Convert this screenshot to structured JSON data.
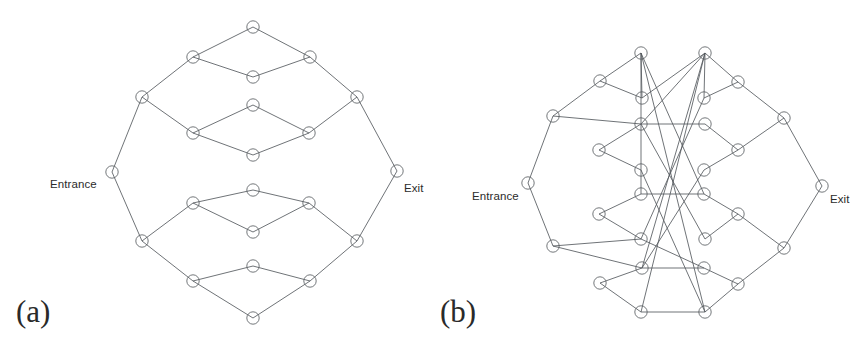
{
  "figure": {
    "background_color": "#ffffff",
    "edge_color": "#555a5e",
    "node_stroke_color": "#5b6063",
    "node_radius": 6.2,
    "terminal_node_radius": 6.2
  },
  "panels": [
    {
      "id": "a",
      "caption": "(a)",
      "caption_x": 16,
      "caption_y": 322,
      "entrance_label": "Entrance",
      "entrance_label_x": 50,
      "entrance_label_y": 188,
      "exit_label": "Exit",
      "exit_label_x": 404,
      "exit_label_y": 192,
      "nodes": [
        {
          "name": "entrance",
          "x": 112,
          "y": 172
        },
        {
          "name": "exit",
          "x": 397,
          "y": 171
        },
        {
          "name": "n-top",
          "x": 253,
          "y": 27
        },
        {
          "name": "n-top-left",
          "x": 193,
          "y": 57
        },
        {
          "name": "n-top-right",
          "x": 310,
          "y": 57
        },
        {
          "name": "n-upper-mid-1",
          "x": 253,
          "y": 77
        },
        {
          "name": "n-upper-left-outer",
          "x": 142,
          "y": 97
        },
        {
          "name": "n-upper-right-outer",
          "x": 357,
          "y": 97
        },
        {
          "name": "n-inner-top",
          "x": 253,
          "y": 105
        },
        {
          "name": "n-inner-upper-left",
          "x": 193,
          "y": 133
        },
        {
          "name": "n-inner-upper-right",
          "x": 309,
          "y": 133
        },
        {
          "name": "n-inner-upper-bottom",
          "x": 253,
          "y": 155
        },
        {
          "name": "n-inner-lower-top",
          "x": 253,
          "y": 190
        },
        {
          "name": "n-inner-lower-left",
          "x": 193,
          "y": 203
        },
        {
          "name": "n-inner-lower-right",
          "x": 309,
          "y": 203
        },
        {
          "name": "n-inner-bottom",
          "x": 253,
          "y": 232
        },
        {
          "name": "n-lower-left-outer",
          "x": 142,
          "y": 241
        },
        {
          "name": "n-lower-right-outer",
          "x": 357,
          "y": 241
        },
        {
          "name": "n-lower-mid-1",
          "x": 253,
          "y": 266
        },
        {
          "name": "n-bottom-left",
          "x": 193,
          "y": 281
        },
        {
          "name": "n-bottom-right",
          "x": 310,
          "y": 281
        },
        {
          "name": "n-bottom",
          "x": 253,
          "y": 318
        }
      ],
      "edges": [
        [
          "entrance",
          "n-upper-left-outer"
        ],
        [
          "entrance",
          "n-lower-left-outer"
        ],
        [
          "exit",
          "n-upper-right-outer"
        ],
        [
          "exit",
          "n-lower-right-outer"
        ],
        [
          "n-upper-left-outer",
          "n-top-left"
        ],
        [
          "n-top-left",
          "n-top"
        ],
        [
          "n-top",
          "n-top-right"
        ],
        [
          "n-top-right",
          "n-upper-right-outer"
        ],
        [
          "n-top-left",
          "n-upper-mid-1"
        ],
        [
          "n-upper-mid-1",
          "n-top-right"
        ],
        [
          "n-upper-left-outer",
          "n-inner-upper-left"
        ],
        [
          "n-inner-upper-left",
          "n-inner-top"
        ],
        [
          "n-inner-top",
          "n-inner-upper-right"
        ],
        [
          "n-inner-upper-right",
          "n-upper-right-outer"
        ],
        [
          "n-inner-upper-left",
          "n-inner-upper-bottom"
        ],
        [
          "n-inner-upper-bottom",
          "n-inner-upper-right"
        ],
        [
          "n-lower-left-outer",
          "n-inner-lower-left"
        ],
        [
          "n-inner-lower-left",
          "n-inner-lower-top"
        ],
        [
          "n-inner-lower-top",
          "n-inner-lower-right"
        ],
        [
          "n-inner-lower-right",
          "n-lower-right-outer"
        ],
        [
          "n-inner-lower-left",
          "n-inner-bottom"
        ],
        [
          "n-inner-bottom",
          "n-inner-lower-right"
        ],
        [
          "n-lower-left-outer",
          "n-bottom-left"
        ],
        [
          "n-bottom-left",
          "n-lower-mid-1"
        ],
        [
          "n-lower-mid-1",
          "n-bottom-right"
        ],
        [
          "n-bottom-right",
          "n-lower-right-outer"
        ],
        [
          "n-bottom-left",
          "n-bottom"
        ],
        [
          "n-bottom",
          "n-bottom-right"
        ]
      ]
    },
    {
      "id": "b",
      "caption": "(b)",
      "caption_x": 8,
      "caption_y": 322,
      "entrance_label": "Entrance",
      "entrance_label_x": 40,
      "entrance_label_y": 200,
      "exit_label": "Exit",
      "exit_label_x": 398,
      "exit_label_y": 203,
      "nodes": [
        {
          "name": "entrance",
          "x": 96,
          "y": 183
        },
        {
          "name": "exit",
          "x": 390,
          "y": 186
        },
        {
          "name": "n-top-left",
          "x": 209,
          "y": 53
        },
        {
          "name": "n-top-right",
          "x": 273,
          "y": 53
        },
        {
          "name": "n-ul-1",
          "x": 168,
          "y": 81
        },
        {
          "name": "n-ur-1",
          "x": 306,
          "y": 82
        },
        {
          "name": "n-ul-2",
          "x": 210,
          "y": 98
        },
        {
          "name": "n-ur-2",
          "x": 272,
          "y": 98
        },
        {
          "name": "n-left-outer-top",
          "x": 121,
          "y": 116
        },
        {
          "name": "n-right-outer-top",
          "x": 352,
          "y": 118
        },
        {
          "name": "n-ul-3",
          "x": 209,
          "y": 124
        },
        {
          "name": "n-ur-3",
          "x": 273,
          "y": 124
        },
        {
          "name": "n-ul-4",
          "x": 167,
          "y": 150
        },
        {
          "name": "n-ur-4",
          "x": 306,
          "y": 150
        },
        {
          "name": "n-ul-5",
          "x": 209,
          "y": 170
        },
        {
          "name": "n-ur-5",
          "x": 272,
          "y": 170
        },
        {
          "name": "n-ll-5",
          "x": 209,
          "y": 194
        },
        {
          "name": "n-lr-5",
          "x": 272,
          "y": 194
        },
        {
          "name": "n-ll-4",
          "x": 167,
          "y": 214
        },
        {
          "name": "n-lr-4",
          "x": 306,
          "y": 214
        },
        {
          "name": "n-ll-3",
          "x": 209,
          "y": 239
        },
        {
          "name": "n-lr-3",
          "x": 273,
          "y": 239
        },
        {
          "name": "n-left-outer-bot",
          "x": 121,
          "y": 246
        },
        {
          "name": "n-right-outer-bot",
          "x": 352,
          "y": 248
        },
        {
          "name": "n-ll-2",
          "x": 210,
          "y": 268
        },
        {
          "name": "n-lr-2",
          "x": 272,
          "y": 268
        },
        {
          "name": "n-ll-1",
          "x": 168,
          "y": 283
        },
        {
          "name": "n-lr-1",
          "x": 306,
          "y": 284
        },
        {
          "name": "n-bot-left",
          "x": 209,
          "y": 312
        },
        {
          "name": "n-bot-right",
          "x": 273,
          "y": 312
        }
      ],
      "edges": [
        [
          "entrance",
          "n-left-outer-top"
        ],
        [
          "entrance",
          "n-left-outer-bot"
        ],
        [
          "exit",
          "n-right-outer-top"
        ],
        [
          "exit",
          "n-right-outer-bot"
        ],
        [
          "n-left-outer-top",
          "n-ul-1"
        ],
        [
          "n-ul-1",
          "n-top-left"
        ],
        [
          "n-top-left",
          "n-ul-2"
        ],
        [
          "n-ul-1",
          "n-ul-2"
        ],
        [
          "n-top-right",
          "n-ur-1"
        ],
        [
          "n-ur-1",
          "n-right-outer-top"
        ],
        [
          "n-top-right",
          "n-ur-2"
        ],
        [
          "n-ur-1",
          "n-ur-2"
        ],
        [
          "n-left-outer-top",
          "n-ul-3"
        ],
        [
          "n-ul-3",
          "n-ul-4"
        ],
        [
          "n-ul-4",
          "n-ul-5"
        ],
        [
          "n-ul-3",
          "n-ur-3"
        ],
        [
          "n-ur-3",
          "n-ur-4"
        ],
        [
          "n-ur-4",
          "n-right-outer-top"
        ],
        [
          "n-ur-4",
          "n-ur-5"
        ],
        [
          "n-left-outer-bot",
          "n-ll-3"
        ],
        [
          "n-ll-5",
          "n-ll-4"
        ],
        [
          "n-ll-4",
          "n-ll-3"
        ],
        [
          "n-ll-5",
          "n-lr-5"
        ],
        [
          "n-lr-5",
          "n-lr-4"
        ],
        [
          "n-lr-4",
          "n-lr-3"
        ],
        [
          "n-lr-4",
          "n-right-outer-bot"
        ],
        [
          "n-left-outer-bot",
          "n-ll-2"
        ],
        [
          "n-ll-2",
          "n-ll-1"
        ],
        [
          "n-ll-1",
          "n-bot-left"
        ],
        [
          "n-ll-2",
          "n-lr-2"
        ],
        [
          "n-lr-2",
          "n-lr-1"
        ],
        [
          "n-lr-1",
          "n-right-outer-bot"
        ],
        [
          "n-lr-1",
          "n-bot-right"
        ],
        [
          "n-bot-left",
          "n-bot-right"
        ],
        [
          "n-top-left",
          "n-ll-5"
        ],
        [
          "n-top-left",
          "n-lr-5"
        ],
        [
          "n-top-left",
          "n-bot-right"
        ],
        [
          "n-top-right",
          "n-ul-2"
        ],
        [
          "n-top-right",
          "n-ul-3"
        ],
        [
          "n-top-right",
          "n-ll-2"
        ],
        [
          "n-top-right",
          "n-bot-left"
        ],
        [
          "n-ul-5",
          "n-bot-right"
        ],
        [
          "n-ur-5",
          "n-ll-2"
        ],
        [
          "n-ur-2",
          "n-ll-3"
        ],
        [
          "n-ul-3",
          "n-lr-3"
        ],
        [
          "n-ll-3",
          "n-lr-2"
        ]
      ]
    }
  ]
}
